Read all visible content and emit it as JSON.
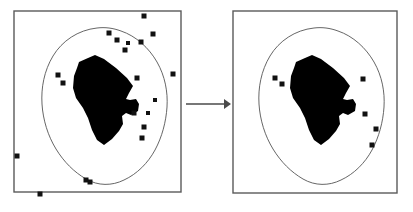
{
  "figure": {
    "title": "Outlier removal on a spatial point set",
    "caption": "",
    "background_color": "#ffffff",
    "width": 413,
    "height": 212
  },
  "colors": {
    "frame_stroke": "#5a5a5a",
    "contour_stroke": "#555555",
    "region_fill": "#000000",
    "marker_fill": "#111111",
    "arrow": "#4a4a4a",
    "panel_background": "#ffffff"
  },
  "panels": [
    {
      "id": "left-panel",
      "label": "before",
      "frame": {
        "x": 14,
        "y": 11,
        "width": 167,
        "height": 181
      },
      "contour_name": "outer-contour",
      "region_name": "filled-region",
      "marker_count": 20,
      "markers": [
        {
          "x": 144,
          "y": 16,
          "size": 5
        },
        {
          "x": 109,
          "y": 33,
          "size": 5
        },
        {
          "x": 153,
          "y": 34,
          "size": 5
        },
        {
          "x": 117,
          "y": 40,
          "size": 5
        },
        {
          "x": 141,
          "y": 42,
          "size": 5
        },
        {
          "x": 125,
          "y": 50,
          "size": 5
        },
        {
          "x": 58,
          "y": 75,
          "size": 5
        },
        {
          "x": 137,
          "y": 78,
          "size": 5
        },
        {
          "x": 63,
          "y": 83,
          "size": 5
        },
        {
          "x": 173,
          "y": 74,
          "size": 5
        },
        {
          "x": 134,
          "y": 113,
          "size": 5
        },
        {
          "x": 144,
          "y": 127,
          "size": 5
        },
        {
          "x": 142,
          "y": 138,
          "size": 5
        },
        {
          "x": 17,
          "y": 156,
          "size": 5
        },
        {
          "x": 86,
          "y": 180,
          "size": 5
        },
        {
          "x": 90,
          "y": 182,
          "size": 5
        },
        {
          "x": 40,
          "y": 194,
          "size": 5
        },
        {
          "x": 128,
          "y": 43,
          "size": 4
        },
        {
          "x": 155,
          "y": 100,
          "size": 4
        },
        {
          "x": 148,
          "y": 113,
          "size": 4
        }
      ]
    },
    {
      "id": "right-panel",
      "label": "after",
      "frame": {
        "x": 233,
        "y": 11,
        "width": 164,
        "height": 182
      },
      "contour_name": "outer-contour",
      "region_name": "filled-region",
      "marker_count": 6,
      "markers": [
        {
          "x": 275,
          "y": 78,
          "size": 5
        },
        {
          "x": 282,
          "y": 84,
          "size": 5
        },
        {
          "x": 363,
          "y": 79,
          "size": 5
        },
        {
          "x": 365,
          "y": 114,
          "size": 5
        },
        {
          "x": 376,
          "y": 129,
          "size": 5
        },
        {
          "x": 372,
          "y": 145,
          "size": 5
        }
      ]
    }
  ],
  "arrow": {
    "name": "transform-arrow",
    "label": "",
    "from_x": 186,
    "to_x": 231,
    "y": 104
  },
  "chart_data": {
    "type": "scatter",
    "title": "Outlier removal on a spatial point set",
    "xlabel": "",
    "ylabel": "",
    "grid": false,
    "legend": "none",
    "series": [
      {
        "name": "before-points",
        "panel": "left-panel",
        "values": [
          [
            144,
            16
          ],
          [
            109,
            33
          ],
          [
            153,
            34
          ],
          [
            117,
            40
          ],
          [
            141,
            42
          ],
          [
            125,
            50
          ],
          [
            58,
            75
          ],
          [
            137,
            78
          ],
          [
            63,
            83
          ],
          [
            173,
            74
          ],
          [
            134,
            113
          ],
          [
            144,
            127
          ],
          [
            142,
            138
          ],
          [
            17,
            156
          ],
          [
            86,
            180
          ],
          [
            90,
            182
          ],
          [
            40,
            194
          ],
          [
            128,
            43
          ],
          [
            155,
            100
          ],
          [
            148,
            113
          ]
        ]
      },
      {
        "name": "after-points",
        "panel": "right-panel",
        "values": [
          [
            275,
            78
          ],
          [
            282,
            84
          ],
          [
            363,
            79
          ],
          [
            365,
            114
          ],
          [
            376,
            129
          ],
          [
            372,
            145
          ]
        ]
      }
    ]
  }
}
